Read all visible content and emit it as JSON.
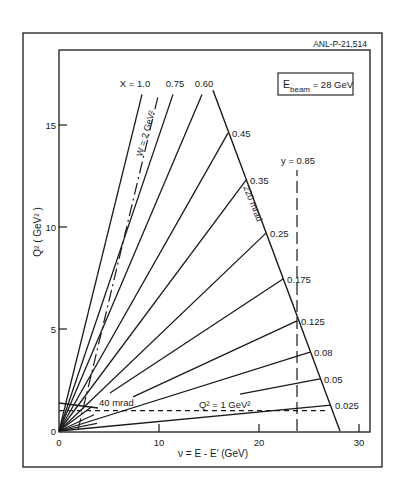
{
  "figure_id": "ANL-P-21,514",
  "chart_data": {
    "type": "line",
    "title": "",
    "xlabel": "ν = E - E′ (GeV)",
    "ylabel": "Q² ( GeV² )",
    "xlim": [
      0,
      31
    ],
    "ylim": [
      0,
      17.4
    ],
    "x_ticks": [
      0,
      10,
      20,
      30
    ],
    "y_ticks": [
      0,
      5,
      10,
      15
    ],
    "grid": false,
    "annotation_box": {
      "main": "E",
      "sub": "beam",
      "rest": " = 28 GeV"
    },
    "x_lines": [
      {
        "label": "X = 1.0",
        "x_value": 1.0,
        "start": [
          0,
          0
        ],
        "end": [
          8.3,
          16.5
        ]
      },
      {
        "label": "0.75",
        "x_value": 0.75,
        "start": [
          0,
          0
        ],
        "end": [
          11.4,
          16.5
        ]
      },
      {
        "label": "0.60",
        "x_value": 0.6,
        "start": [
          0,
          0
        ],
        "end": [
          14.3,
          16.5
        ]
      },
      {
        "label": "0.45",
        "x_value": 0.45,
        "start": [
          0,
          0
        ],
        "end": [
          16.9,
          14.6
        ]
      },
      {
        "label": "0.35",
        "x_value": 0.35,
        "start": [
          0,
          0
        ],
        "end": [
          18.7,
          12.3
        ]
      },
      {
        "label": "0.25",
        "x_value": 0.25,
        "start": [
          0,
          0
        ],
        "end": [
          20.7,
          9.7
        ]
      },
      {
        "label": "0.175",
        "x_value": 0.175,
        "start": [
          5.1,
          1.86
        ],
        "end": [
          22.4,
          7.45
        ],
        "stub_end": [
          3.3,
          1.2
        ]
      },
      {
        "label": "0.125",
        "x_value": 0.125,
        "start": [
          7.4,
          1.67
        ],
        "end": [
          23.8,
          5.4
        ],
        "stub_end": [
          3.5,
          0.8
        ]
      },
      {
        "label": "0.08",
        "x_value": 0.08,
        "start": [
          0,
          0
        ],
        "end": [
          25.1,
          3.87
        ]
      },
      {
        "label": "0.05",
        "x_value": 0.05,
        "start": [
          18.1,
          1.81
        ],
        "end": [
          26.1,
          2.55
        ],
        "stub_end": [
          3.8,
          0.37
        ]
      },
      {
        "label": "0.025",
        "x_value": 0.025,
        "start": [
          0,
          0
        ],
        "end": [
          27.2,
          1.27
        ]
      }
    ],
    "cuts": [
      {
        "name": "220 mrad",
        "label": "220 mrad",
        "style": "solid",
        "start": [
          15.4,
          16.7
        ],
        "end": [
          28.1,
          0
        ]
      },
      {
        "name": "40 mrad",
        "label": "40 mrad",
        "style": "solid",
        "start": [
          0,
          1.37
        ],
        "end": [
          3.9,
          1.13
        ]
      },
      {
        "name": "Q2=1",
        "label": "Q² = 1 GeV²",
        "style": "dashed",
        "start": [
          0,
          1.0
        ],
        "end": [
          27.0,
          1.0
        ]
      },
      {
        "name": "y=0.85",
        "label": "y = 0.85",
        "style": "long-dash",
        "start": [
          23.8,
          0
        ],
        "end": [
          23.8,
          12.8
        ]
      },
      {
        "name": "W=2",
        "label": "W = 2 GeV²",
        "style": "dash-dot",
        "start": [
          1.9,
          0.05
        ],
        "end": [
          9.9,
          16.4
        ]
      }
    ]
  }
}
